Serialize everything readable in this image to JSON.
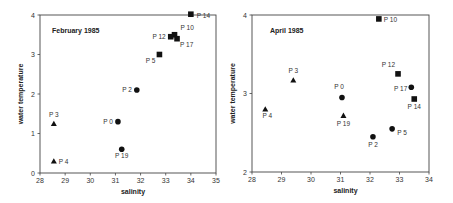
{
  "chart_data": [
    {
      "type": "scatter",
      "title": "February 1985",
      "xlabel": "salinity",
      "ylabel": "water temperature",
      "xlim": [
        28,
        35
      ],
      "ylim": [
        0,
        4
      ],
      "xticks": [
        28,
        29,
        30,
        31,
        32,
        33,
        34,
        35
      ],
      "yticks": [
        0,
        1,
        2,
        3,
        4
      ],
      "grid": false,
      "legend": null,
      "points": [
        {
          "label": "P 14",
          "x": 34.0,
          "y": 4.02,
          "marker": "square"
        },
        {
          "label": "P 10",
          "x": 33.35,
          "y": 3.5,
          "marker": "square"
        },
        {
          "label": "P 12",
          "x": 33.2,
          "y": 3.45,
          "marker": "square"
        },
        {
          "label": "P 17",
          "x": 33.45,
          "y": 3.4,
          "marker": "square"
        },
        {
          "label": "P 5",
          "x": 32.75,
          "y": 3.0,
          "marker": "square"
        },
        {
          "label": "P 2",
          "x": 31.85,
          "y": 2.1,
          "marker": "circle"
        },
        {
          "label": "P 0",
          "x": 31.1,
          "y": 1.3,
          "marker": "circle"
        },
        {
          "label": "P 19",
          "x": 31.25,
          "y": 0.6,
          "marker": "circle"
        },
        {
          "label": "P 3",
          "x": 28.55,
          "y": 1.25,
          "marker": "triangle"
        },
        {
          "label": "P 4",
          "x": 28.55,
          "y": 0.3,
          "marker": "triangle"
        }
      ]
    },
    {
      "type": "scatter",
      "title": "April 1985",
      "xlabel": "salinity",
      "ylabel": "water temperature",
      "xlim": [
        28,
        34
      ],
      "ylim": [
        2,
        4
      ],
      "xticks": [
        28,
        29,
        30,
        31,
        32,
        33,
        34
      ],
      "yticks": [
        2,
        3,
        4
      ],
      "grid": false,
      "legend": null,
      "points": [
        {
          "label": "P 10",
          "x": 32.3,
          "y": 3.95,
          "marker": "square"
        },
        {
          "label": "P 12",
          "x": 32.95,
          "y": 3.25,
          "marker": "square"
        },
        {
          "label": "P 17",
          "x": 33.4,
          "y": 3.08,
          "marker": "circle"
        },
        {
          "label": "P 14",
          "x": 33.5,
          "y": 2.93,
          "marker": "square"
        },
        {
          "label": "P 5",
          "x": 32.75,
          "y": 2.55,
          "marker": "circle"
        },
        {
          "label": "P 2",
          "x": 32.1,
          "y": 2.45,
          "marker": "circle"
        },
        {
          "label": "P 0",
          "x": 31.05,
          "y": 2.95,
          "marker": "circle"
        },
        {
          "label": "P 19",
          "x": 31.1,
          "y": 2.72,
          "marker": "triangle"
        },
        {
          "label": "P 3",
          "x": 29.4,
          "y": 3.17,
          "marker": "triangle"
        },
        {
          "label": "P 4",
          "x": 28.45,
          "y": 2.8,
          "marker": "triangle"
        }
      ]
    }
  ]
}
